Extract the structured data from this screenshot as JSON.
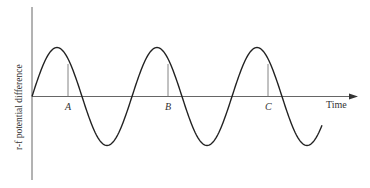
{
  "diagram": {
    "ylabel": "r-f potential difference",
    "xlabel": "Time",
    "markers": [
      {
        "label": "A"
      },
      {
        "label": "B"
      },
      {
        "label": "C"
      }
    ],
    "wave": {
      "type": "sine",
      "cycles": 2.9,
      "color": "#222222"
    },
    "axis_color": "#555555"
  }
}
